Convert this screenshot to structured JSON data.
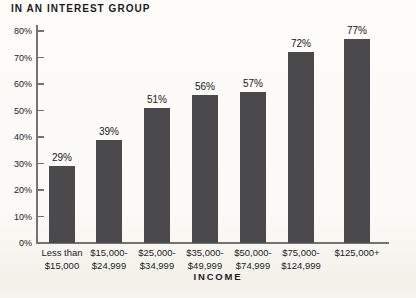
{
  "chart_data": {
    "type": "bar",
    "title": "IN AN INTEREST GROUP",
    "xlabel": "INCOME",
    "categories": [
      [
        "Less than",
        "$15,000"
      ],
      [
        "$15,000-",
        "$24,999"
      ],
      [
        "$25,000-",
        "$34,999"
      ],
      [
        "$35,000-",
        "$49,999"
      ],
      [
        "$50,000-",
        "$74,999"
      ],
      [
        "$75,000-",
        "$124,999"
      ],
      [
        "$125,000+"
      ]
    ],
    "values": [
      29,
      39,
      51,
      56,
      57,
      72,
      77
    ],
    "value_labels": [
      "29%",
      "39%",
      "51%",
      "56%",
      "57%",
      "72%",
      "77%"
    ],
    "ylim": [
      0,
      80
    ],
    "ytick_step": 10,
    "ytick_labels": [
      "0%",
      "10%",
      "20%",
      "30%",
      "40%",
      "50%",
      "60%",
      "70%",
      "80%"
    ],
    "grid": false,
    "legend": null,
    "colors": {
      "bar": "#4a4a4c",
      "axis": "#737373",
      "text": "#1c1c1c",
      "background": "#fbfaf6"
    }
  }
}
